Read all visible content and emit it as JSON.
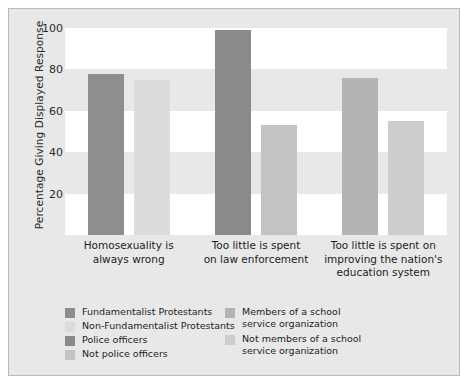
{
  "chart_data": {
    "type": "bar",
    "title": "",
    "subtitle": "",
    "xlabel": "",
    "ylabel": "Percentage Giving Displayed Response",
    "ylim": [
      0,
      100
    ],
    "yticks": [
      0,
      20,
      40,
      60,
      80,
      100
    ],
    "ytick_labels": [
      "20",
      "40",
      "60",
      "80",
      "100"
    ],
    "grid": "alternating horizontal bands",
    "legend_position": "bottom",
    "categories": [
      "Homosexuality is always wrong",
      "Too little is spent on law enforcement",
      "Too little is spent on improving the nation's education system"
    ],
    "category_lines": [
      [
        "Homosexuality is",
        "always wrong"
      ],
      [
        "Too little is spent",
        "on law enforcement"
      ],
      [
        "Too little is spent on",
        "improving the nation's",
        "education system"
      ]
    ],
    "series": [
      {
        "name": "Fundamentalist Protestants",
        "color": "#8e8e8e",
        "category": 0,
        "value": 78
      },
      {
        "name": "Non-Fundamentalist Protestants",
        "color": "#dcdcdc",
        "category": 0,
        "value": 75
      },
      {
        "name": "Police officers",
        "color": "#8a8a8a",
        "category": 1,
        "value": 99
      },
      {
        "name": "Not police officers",
        "color": "#c3c3c3",
        "category": 1,
        "value": 53
      },
      {
        "name": "Members of a school service organization",
        "color": "#b4b4b4",
        "category": 2,
        "value": 76
      },
      {
        "name": "Not members of a school service organization",
        "color": "#cdcdcd",
        "category": 2,
        "value": 55
      }
    ]
  },
  "legend": {
    "left_column": [
      {
        "label": "Fundamentalist Protestants",
        "color": "#8e8e8e"
      },
      {
        "label": "Non-Fundamentalist Protestants",
        "color": "#dcdcdc"
      },
      {
        "label": "Police officers",
        "color": "#8a8a8a"
      },
      {
        "label": "Not police officers",
        "color": "#c3c3c3"
      }
    ],
    "right_column": [
      {
        "label_line1": "Members of a school",
        "label_line2": "service organization",
        "color": "#b4b4b4"
      },
      {
        "label_line1": "Not members of a school",
        "label_line2": "service organization",
        "color": "#cdcdcd"
      }
    ]
  },
  "style": {
    "figure_background": "#e8e8e8",
    "band_white": "#ffffff",
    "band_gray": "#e8e8e8",
    "border_color": "#b9b9b9",
    "text_color": "#1d1d1d"
  }
}
